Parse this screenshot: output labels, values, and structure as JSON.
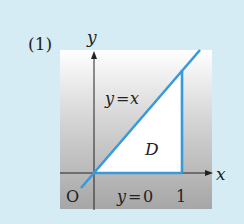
{
  "figure": {
    "problem_label": "(1)",
    "axes": {
      "x_label": "x",
      "y_label": "y",
      "origin_label": "O"
    },
    "ticks": {
      "x_one": "1"
    },
    "curves": [
      {
        "label": "y=x",
        "label_left": "y",
        "label_eq": "=",
        "label_right": "x"
      },
      {
        "label": "y=0",
        "label_left": "y",
        "label_eq": "=",
        "label_right": "0"
      }
    ],
    "region_label": "D",
    "colors": {
      "background": "#d6ecf5",
      "region": "#ffffff",
      "line": "#3a9ad9",
      "axis": "#222222",
      "panel_top": "#ffffff",
      "panel_bottom": "#a8a8a8"
    }
  }
}
